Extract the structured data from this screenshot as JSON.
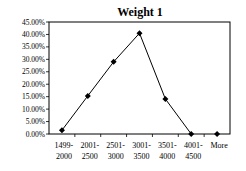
{
  "chart_data": {
    "type": "line",
    "title": "Weight 1",
    "xlabel": "",
    "ylabel": "",
    "categories": [
      [
        "1499-",
        "2000"
      ],
      [
        "2001-",
        "2500"
      ],
      [
        "2501-",
        "3000"
      ],
      [
        "3001-",
        "3500"
      ],
      [
        "3501-",
        "4000"
      ],
      [
        "4001-",
        "4500"
      ],
      [
        "More",
        ""
      ]
    ],
    "category_labels": [
      "1499-2000",
      "2001-2500",
      "2501-3000",
      "3001-3500",
      "3501-4000",
      "4001-4500",
      "More"
    ],
    "series": [
      {
        "name": "Weight 1",
        "values": [
          1.5,
          15.3,
          29.0,
          40.5,
          14.1,
          0.0,
          0.0
        ],
        "marker": "diamond",
        "color": "#000000"
      }
    ],
    "ylim": [
      0,
      45
    ],
    "yticks": [
      0,
      5,
      10,
      15,
      20,
      25,
      30,
      35,
      40,
      45
    ],
    "ytick_labels": [
      "0.00%",
      "5.00%",
      "10.00%",
      "15.00%",
      "20.00%",
      "25.00%",
      "30.00%",
      "35.00%",
      "40.00%",
      "45.00%"
    ],
    "grid": false,
    "legend": "none",
    "plot_border": true
  }
}
